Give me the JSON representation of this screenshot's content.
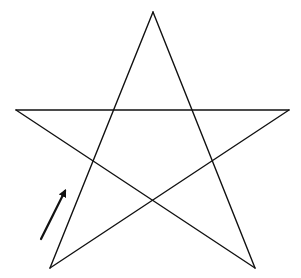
{
  "diagram": {
    "type": "pentagram",
    "width": 301,
    "height": 278,
    "background": "#ffffff",
    "stroke_color": "#111111",
    "stroke_width": 1.4,
    "vertices": {
      "top": [
        153,
        12
      ],
      "left": [
        16,
        110
      ],
      "right": [
        289,
        110
      ],
      "bottom_left": [
        50,
        268
      ],
      "bottom_right": [
        255,
        268
      ]
    },
    "strokes": [
      {
        "from": "bottom_left",
        "to": "top"
      },
      {
        "from": "top",
        "to": "bottom_right"
      },
      {
        "from": "bottom_right",
        "to": "left"
      },
      {
        "from": "left",
        "to": "right"
      },
      {
        "from": "right",
        "to": "bottom_left"
      }
    ],
    "arrow": {
      "description": "direction of drawing",
      "tail": [
        41,
        239
      ],
      "head": [
        66,
        189
      ],
      "color": "#111111",
      "stroke_width": 2.2
    }
  }
}
